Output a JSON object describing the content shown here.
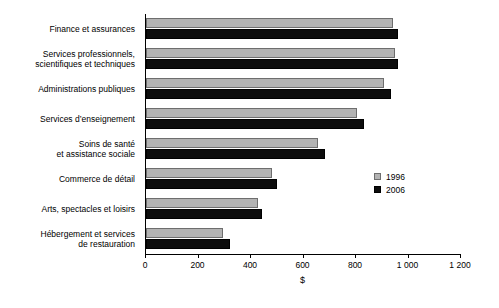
{
  "chart_data": {
    "type": "bar",
    "orientation": "horizontal",
    "title": "",
    "xlabel": "$",
    "ylabel": "",
    "xlim": [
      0,
      1200
    ],
    "xticks": [
      0,
      200,
      400,
      600,
      800,
      1000,
      1200
    ],
    "xticklabels": [
      "0",
      "200",
      "400",
      "600",
      "800",
      "1 000",
      "1 200"
    ],
    "grid": false,
    "legend_position": "center-right",
    "categories": [
      "Finance et assurances",
      "Services professionnels,\nscientifiques et techniques",
      "Administrations publiques",
      "Services d’enseignement",
      "Soins de santé\net assistance sociale",
      "Commerce de détail",
      "Arts, spectacles et loisirs",
      "Hébergement et services\nde restauration"
    ],
    "series": [
      {
        "name": "1996",
        "color": "#b3b3b3",
        "values": [
          940,
          950,
          905,
          805,
          655,
          480,
          425,
          295
        ]
      },
      {
        "name": "2006",
        "color": "#0d0d0d",
        "values": [
          960,
          960,
          935,
          830,
          680,
          500,
          440,
          320
        ]
      }
    ]
  },
  "legend": {
    "items": [
      {
        "label": "1996",
        "color": "#b3b3b3"
      },
      {
        "label": "2006",
        "color": "#0d0d0d"
      }
    ]
  }
}
